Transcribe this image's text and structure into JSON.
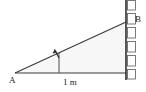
{
  "figure": {
    "type": "geometry-diagram",
    "width": 146,
    "height": 92,
    "background_color": "#ffffff"
  },
  "labels": {
    "vertex_a": "A",
    "vertex_b": "B",
    "base_measure": "1 m"
  },
  "geometry": {
    "vertex_a": {
      "x": 15,
      "y": 73
    },
    "vertex_b": {
      "x": 126,
      "y": 22
    },
    "vertex_c": {
      "x": 126,
      "y": 73
    },
    "baseline_y": 73,
    "wall_x": 126,
    "angle_marker": {
      "x": 59,
      "y": 73,
      "arrow_tip_x": 55,
      "arrow_tip_y": 50
    }
  },
  "wall": {
    "bricks": [
      {
        "x": 127,
        "y": 0,
        "w": 9,
        "h": 10
      },
      {
        "x": 127,
        "y": 13,
        "w": 9,
        "h": 11
      },
      {
        "x": 127,
        "y": 27,
        "w": 9,
        "h": 11
      },
      {
        "x": 127,
        "y": 41,
        "w": 9,
        "h": 11
      },
      {
        "x": 127,
        "y": 55,
        "w": 9,
        "h": 11
      },
      {
        "x": 127,
        "y": 69,
        "w": 9,
        "h": 10
      }
    ]
  },
  "colors": {
    "line": "#3a3a3a",
    "wall_line": "#2e2e2e",
    "brick_stroke": "#6a6a6a",
    "brick_fill": "#ffffff",
    "triangle_fill": "#f7f7f7",
    "text": "#1a1a1a"
  }
}
